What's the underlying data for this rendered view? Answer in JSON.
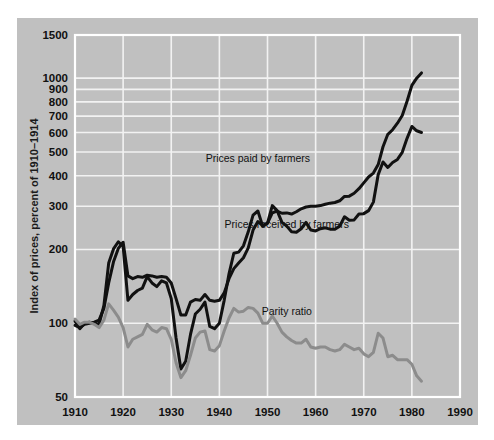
{
  "chart_data": {
    "type": "line",
    "title": "",
    "xlabel": "",
    "ylabel": "Index of prices, percent of 1910–1914",
    "scale_y": "log",
    "grid": true,
    "legend_position": "inline-annotations",
    "xlim": [
      1910,
      1990
    ],
    "ylim": [
      50,
      1500
    ],
    "xticks": [
      "1910",
      "1920",
      "1930",
      "1940",
      "1950",
      "1960",
      "1970",
      "1980",
      "1990"
    ],
    "yticks": [
      "50",
      "100",
      "200",
      "300",
      "400",
      "500",
      "600",
      "700",
      "800",
      "900",
      "1000",
      "1500"
    ],
    "annotations": [
      {
        "name": "prices-paid-label",
        "text": "Prices paid by farmers",
        "x": 1948,
        "y": 455
      },
      {
        "name": "prices-received-label",
        "text": "Prices received by farmers",
        "x": 1954,
        "y": 245
      },
      {
        "name": "parity-ratio-label",
        "text": "Parity ratio",
        "x": 1954,
        "y": 108
      }
    ],
    "series": [
      {
        "name": "Prices paid by farmers",
        "color": "#111111",
        "width": 3.0,
        "x": [
          1910,
          1911,
          1912,
          1913,
          1914,
          1915,
          1916,
          1917,
          1918,
          1919,
          1920,
          1921,
          1922,
          1923,
          1924,
          1925,
          1926,
          1927,
          1928,
          1929,
          1930,
          1931,
          1932,
          1933,
          1934,
          1935,
          1936,
          1937,
          1938,
          1939,
          1940,
          1941,
          1942,
          1943,
          1944,
          1945,
          1946,
          1947,
          1948,
          1949,
          1950,
          1951,
          1952,
          1953,
          1954,
          1955,
          1956,
          1957,
          1958,
          1959,
          1960,
          1961,
          1962,
          1963,
          1964,
          1965,
          1966,
          1967,
          1968,
          1969,
          1970,
          1971,
          1972,
          1973,
          1974,
          1975,
          1976,
          1977,
          1978,
          1979,
          1980,
          1981,
          1982
        ],
        "y": [
          98,
          96,
          99,
          100,
          101,
          103,
          115,
          146,
          178,
          202,
          214,
          156,
          152,
          155,
          154,
          157,
          156,
          154,
          155,
          154,
          146,
          126,
          108,
          108,
          122,
          125,
          124,
          131,
          124,
          123,
          124,
          133,
          152,
          167,
          176,
          185,
          203,
          240,
          260,
          250,
          256,
          282,
          287,
          281,
          282,
          279,
          285,
          293,
          298,
          300,
          300,
          302,
          306,
          309,
          311,
          316,
          329,
          330,
          339,
          354,
          374,
          395,
          410,
          444,
          525,
          590,
          616,
          655,
          704,
          805,
          935,
          1000,
          1050
        ]
      },
      {
        "name": "Prices received by farmers",
        "color": "#111111",
        "width": 3.0,
        "x": [
          1910,
          1911,
          1912,
          1913,
          1914,
          1915,
          1916,
          1917,
          1918,
          1919,
          1920,
          1921,
          1922,
          1923,
          1924,
          1925,
          1926,
          1927,
          1928,
          1929,
          1930,
          1931,
          1932,
          1933,
          1934,
          1935,
          1936,
          1937,
          1938,
          1939,
          1940,
          1941,
          1942,
          1943,
          1944,
          1945,
          1946,
          1947,
          1948,
          1949,
          1950,
          1951,
          1952,
          1953,
          1954,
          1955,
          1956,
          1957,
          1958,
          1959,
          1960,
          1961,
          1962,
          1963,
          1964,
          1965,
          1966,
          1967,
          1968,
          1969,
          1970,
          1971,
          1972,
          1973,
          1974,
          1975,
          1976,
          1977,
          1978,
          1979,
          1980,
          1981,
          1982
        ],
        "y": [
          102,
          95,
          100,
          101,
          100,
          99,
          118,
          176,
          201,
          215,
          206,
          124,
          131,
          136,
          139,
          155,
          146,
          141,
          149,
          146,
          126,
          87,
          65,
          70,
          90,
          109,
          114,
          122,
          97,
          95,
          100,
          124,
          159,
          193,
          195,
          207,
          236,
          276,
          287,
          249,
          256,
          302,
          288,
          258,
          249,
          236,
          235,
          243,
          258,
          240,
          238,
          243,
          245,
          242,
          242,
          249,
          272,
          263,
          264,
          279,
          280,
          288,
          312,
          404,
          455,
          432,
          453,
          466,
          498,
          568,
          635,
          610,
          600
        ]
      },
      {
        "name": "Parity ratio",
        "color": "#8c8c8c",
        "width": 3.0,
        "x": [
          1910,
          1911,
          1912,
          1913,
          1914,
          1915,
          1916,
          1917,
          1918,
          1919,
          1920,
          1921,
          1922,
          1923,
          1924,
          1925,
          1926,
          1927,
          1928,
          1929,
          1930,
          1931,
          1932,
          1933,
          1934,
          1935,
          1936,
          1937,
          1938,
          1939,
          1940,
          1941,
          1942,
          1943,
          1944,
          1945,
          1946,
          1947,
          1948,
          1949,
          1950,
          1951,
          1952,
          1953,
          1954,
          1955,
          1956,
          1957,
          1958,
          1959,
          1960,
          1961,
          1962,
          1963,
          1964,
          1965,
          1966,
          1967,
          1968,
          1969,
          1970,
          1971,
          1972,
          1973,
          1974,
          1975,
          1976,
          1977,
          1978,
          1979,
          1980,
          1981,
          1982
        ],
        "y": [
          104,
          99,
          101,
          101,
          99,
          96,
          103,
          120,
          113,
          106,
          96,
          80,
          86,
          88,
          90,
          99,
          94,
          92,
          96,
          95,
          86,
          69,
          60,
          64,
          74,
          87,
          92,
          93,
          78,
          77,
          81,
          93,
          105,
          115,
          111,
          112,
          116,
          115,
          110,
          100,
          100,
          107,
          100,
          92,
          88,
          85,
          83,
          83,
          86,
          80,
          79,
          80,
          80,
          78,
          77,
          78,
          82,
          80,
          78,
          79,
          75,
          73,
          76,
          91,
          87,
          73,
          74,
          71,
          71,
          71,
          68,
          61,
          58
        ]
      }
    ]
  },
  "axes": {
    "y_title": "Index of prices, percent of 1910–1914"
  }
}
